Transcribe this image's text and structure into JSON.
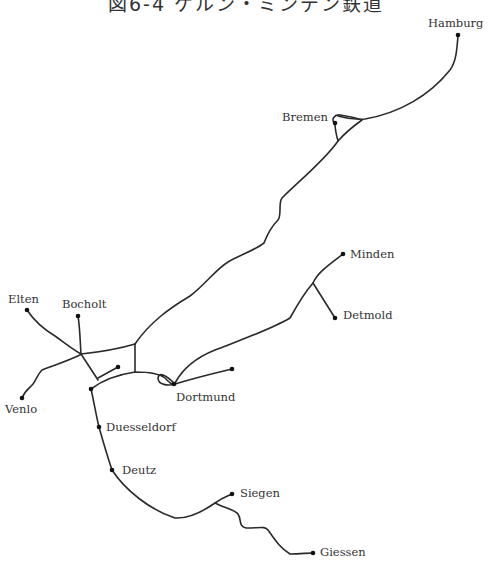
{
  "title": "図6-4 ケルン・ミンデン鉄道",
  "cities": [
    {
      "name": "Hamburg",
      "x": 458,
      "y": 35,
      "label_x": 428,
      "label_y": 27
    },
    {
      "name": "Bremen",
      "x": 335,
      "y": 123,
      "label_x": 282,
      "label_y": 121
    },
    {
      "name": "Minden",
      "x": 343,
      "y": 254,
      "label_x": 350,
      "label_y": 258
    },
    {
      "name": "Detmold",
      "x": 335,
      "y": 318,
      "label_x": 343,
      "label_y": 319
    },
    {
      "name": "Elten",
      "x": 27,
      "y": 310,
      "label_x": 8,
      "label_y": 303
    },
    {
      "name": "Bocholt",
      "x": 78,
      "y": 316,
      "label_x": 62,
      "label_y": 308
    },
    {
      "name": "Venlo",
      "x": 22,
      "y": 398,
      "label_x": 5,
      "label_y": 413
    },
    {
      "name": "Dortmund",
      "x": 174,
      "y": 384,
      "label_x": 176,
      "label_y": 401
    },
    {
      "name": "Duesseldorf",
      "x": 99,
      "y": 427,
      "label_x": 106,
      "label_y": 431
    },
    {
      "name": "Deutz",
      "x": 112,
      "y": 470,
      "label_x": 122,
      "label_y": 474
    },
    {
      "name": "Siegen",
      "x": 232,
      "y": 494,
      "label_x": 240,
      "label_y": 497
    },
    {
      "name": "Giessen",
      "x": 313,
      "y": 553,
      "label_x": 320,
      "label_y": 556
    }
  ],
  "endpoints": [
    {
      "name": "branch-end-east-dortmund",
      "x": 232,
      "y": 369
    },
    {
      "name": "branch-end-central",
      "x": 118,
      "y": 367
    },
    {
      "name": "junction-91-389",
      "x": 91,
      "y": 389
    }
  ],
  "routes": [
    {
      "name": "hamburg-bremen",
      "d": "M458,35 C457,50 456,62 450,70 C430,95 400,113 365,119 C350,120 345,118 338,116"
    },
    {
      "name": "bremen-loop",
      "d": "M335,123 C330,120 335,114 340,115 C345,116 354,117 362,120 C355,125 345,133 338,141 C336,134 335,128 335,123"
    },
    {
      "name": "bremen-dortmund-trunk",
      "d": "M338,141 C325,160 300,180 282,198 C278,203 282,215 278,220 C270,228 267,235 264,243 C255,250 240,255 228,262 C215,270 205,285 190,296 C170,308 150,322 135,344"
    },
    {
      "name": "minden-dortmund",
      "d": "M343,254 C330,264 318,272 313,283 C305,292 300,300 290,318 C270,330 235,342 215,350 C195,358 182,370 175,383"
    },
    {
      "name": "detmold-branch",
      "d": "M313,283 L335,318"
    },
    {
      "name": "elten-junction",
      "d": "M27,310 C35,322 45,330 55,336 C65,343 72,349 81,354"
    },
    {
      "name": "bocholt-junction",
      "d": "M78,316 C80,328 80,340 81,354"
    },
    {
      "name": "venlo-junction",
      "d": "M22,398 C25,390 30,388 33,384 C37,378 38,374 42,370 C52,366 65,362 80,355"
    },
    {
      "name": "junction-north-cross",
      "d": "M81,354 C100,352 115,350 135,344"
    },
    {
      "name": "cross-vertical",
      "d": "M135,344 L135,372"
    },
    {
      "name": "junction-south-diag",
      "d": "M81,354 L98,380"
    },
    {
      "name": "central-branch",
      "d": "M98,378 L118,367"
    },
    {
      "name": "dortmund-curve",
      "d": "M91,389 C100,382 115,375 135,372 C150,372 160,374 165,378 C170,383 172,385 175,384 C168,386 158,385 158,378 C159,372 165,374 175,384"
    },
    {
      "name": "dortmund-east-branch",
      "d": "M175,384 C195,378 215,373 232,369"
    },
    {
      "name": "duesseldorf-line",
      "d": "M91,389 C94,402 96,415 99,427 C104,445 108,458 112,470 C125,490 150,510 175,518 C190,519 205,510 215,503 C222,498 228,496 232,494"
    },
    {
      "name": "giessen-branch",
      "d": "M215,503 C225,508 235,510 238,514 C242,520 238,526 246,528 C260,528 265,526 268,530 C275,540 280,548 290,554 C300,554 307,553 313,553"
    }
  ]
}
